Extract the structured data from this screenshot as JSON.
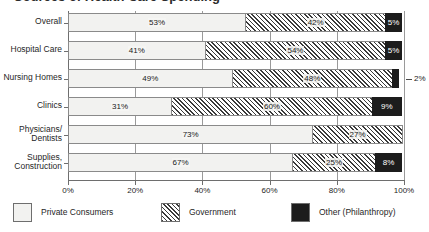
{
  "title": "Sources of Health Care Spending",
  "axis": {
    "x_ticks": [
      "0%",
      "20%",
      "40%",
      "60%",
      "80%",
      "100%"
    ],
    "x_min": 0,
    "x_max": 100
  },
  "legend": {
    "items": [
      {
        "label": "Private Consumers",
        "swatch": "light-dotted-swatch",
        "color": "#f2f2f0"
      },
      {
        "label": "Government",
        "swatch": "diagonal-hatch-swatch",
        "color": "#3a3a3a"
      },
      {
        "label": "Other (Philanthropy)",
        "swatch": "solid-black-swatch",
        "color": "#1c1c1c"
      }
    ]
  },
  "chart_data": {
    "type": "bar",
    "orientation": "horizontal",
    "stacked": true,
    "normalized": true,
    "title": "Sources of Health Care Spending",
    "xlabel": "",
    "ylabel": "",
    "xlim": [
      0,
      100
    ],
    "xticks": [
      0,
      20,
      40,
      60,
      80,
      100
    ],
    "xticklabels": [
      "0%",
      "20%",
      "40%",
      "60%",
      "80%",
      "100%"
    ],
    "grid": true,
    "legend_position": "bottom-left",
    "categories": [
      "Overall",
      "Hospital Care",
      "Nursing Homes",
      "Clinics",
      "Physicians/\nDentists",
      "Supplies,\nConstruction"
    ],
    "series": [
      {
        "name": "Private Consumers",
        "values": [
          53,
          41,
          49,
          31,
          73,
          67
        ],
        "labels": [
          "53%",
          "41%",
          "49%",
          "31%",
          "73%",
          "67%"
        ]
      },
      {
        "name": "Government",
        "values": [
          42,
          54,
          48,
          60,
          27,
          25
        ],
        "labels": [
          "42%",
          "54%",
          "48%",
          "60%",
          "27%",
          "25%"
        ]
      },
      {
        "name": "Other (Philanthropy)",
        "values": [
          5,
          5,
          2,
          9,
          0,
          8
        ],
        "labels": [
          "5%",
          "5%",
          "2%",
          "9%",
          "",
          "8%"
        ]
      }
    ],
    "rows": [
      {
        "category": "Overall",
        "segments": [
          {
            "series": "Private Consumers",
            "value": 53,
            "label": "53%",
            "label_placement": "inside"
          },
          {
            "series": "Government",
            "value": 42,
            "label": "42%",
            "label_placement": "inside"
          },
          {
            "series": "Other (Philanthropy)",
            "value": 5,
            "label": "5%",
            "label_placement": "inside"
          }
        ]
      },
      {
        "category": "Hospital Care",
        "segments": [
          {
            "series": "Private Consumers",
            "value": 41,
            "label": "41%",
            "label_placement": "inside"
          },
          {
            "series": "Government",
            "value": 54,
            "label": "54%",
            "label_placement": "inside"
          },
          {
            "series": "Other (Philanthropy)",
            "value": 5,
            "label": "5%",
            "label_placement": "inside"
          }
        ]
      },
      {
        "category": "Nursing Homes",
        "segments": [
          {
            "series": "Private Consumers",
            "value": 49,
            "label": "49%",
            "label_placement": "inside"
          },
          {
            "series": "Government",
            "value": 48,
            "label": "48%",
            "label_placement": "inside"
          },
          {
            "series": "Other (Philanthropy)",
            "value": 2,
            "label": "2%",
            "label_placement": "outside"
          }
        ]
      },
      {
        "category": "Clinics",
        "segments": [
          {
            "series": "Private Consumers",
            "value": 31,
            "label": "31%",
            "label_placement": "inside"
          },
          {
            "series": "Government",
            "value": 60,
            "label": "60%",
            "label_placement": "inside"
          },
          {
            "series": "Other (Philanthropy)",
            "value": 9,
            "label": "9%",
            "label_placement": "inside"
          }
        ]
      },
      {
        "category": "Physicians/\nDentists",
        "segments": [
          {
            "series": "Private Consumers",
            "value": 73,
            "label": "73%",
            "label_placement": "inside"
          },
          {
            "series": "Government",
            "value": 27,
            "label": "27%",
            "label_placement": "inside"
          }
        ]
      },
      {
        "category": "Supplies,\nConstruction",
        "segments": [
          {
            "series": "Private Consumers",
            "value": 67,
            "label": "67%",
            "label_placement": "inside"
          },
          {
            "series": "Government",
            "value": 25,
            "label": "25%",
            "label_placement": "inside"
          },
          {
            "series": "Other (Philanthropy)",
            "value": 8,
            "label": "8%",
            "label_placement": "inside"
          }
        ]
      }
    ]
  }
}
